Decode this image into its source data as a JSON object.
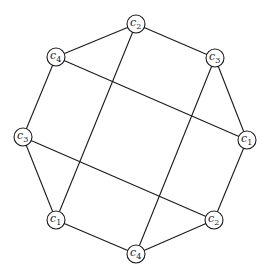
{
  "diagram": {
    "type": "graph",
    "node_radius": 9,
    "nodes": [
      {
        "id": "n_top",
        "base": "c",
        "sub": "2",
        "x": 136,
        "y": 24
      },
      {
        "id": "n_ul",
        "base": "c",
        "sub": "4",
        "x": 56,
        "y": 57
      },
      {
        "id": "n_ur",
        "base": "c",
        "sub": "3",
        "x": 215,
        "y": 58
      },
      {
        "id": "n_l",
        "base": "c",
        "sub": "3",
        "x": 23,
        "y": 137
      },
      {
        "id": "n_r",
        "base": "c",
        "sub": "1",
        "x": 247,
        "y": 140
      },
      {
        "id": "n_ll",
        "base": "c",
        "sub": "1",
        "x": 56,
        "y": 220
      },
      {
        "id": "n_lr",
        "base": "c",
        "sub": "2",
        "x": 214,
        "y": 220
      },
      {
        "id": "n_bot",
        "base": "c",
        "sub": "4",
        "x": 136,
        "y": 254
      }
    ],
    "edges": [
      [
        "n_top",
        "n_ul"
      ],
      [
        "n_top",
        "n_ur"
      ],
      [
        "n_ul",
        "n_l"
      ],
      [
        "n_ur",
        "n_r"
      ],
      [
        "n_l",
        "n_ll"
      ],
      [
        "n_r",
        "n_lr"
      ],
      [
        "n_ll",
        "n_bot"
      ],
      [
        "n_lr",
        "n_bot"
      ],
      [
        "n_ul",
        "n_r"
      ],
      [
        "n_top",
        "n_ll"
      ],
      [
        "n_ur",
        "n_bot"
      ],
      [
        "n_l",
        "n_lr"
      ]
    ]
  }
}
